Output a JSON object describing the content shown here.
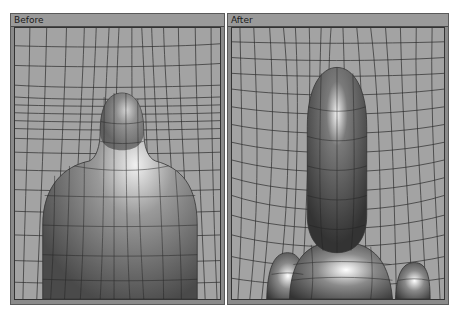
{
  "panels": [
    {
      "title": "Before",
      "description": "mesh-viewport showing bottle-shaped body with grid deformation"
    },
    {
      "title": "After",
      "description": "mesh-viewport showing separated head and shoulder shapes with grid deformation"
    }
  ],
  "colors": {
    "panel_frame": "#8a8a8a",
    "titlebar": "#9a9a9a",
    "viewport_bg": "#a3a3a3",
    "grid_line": "#2a2a2a"
  }
}
